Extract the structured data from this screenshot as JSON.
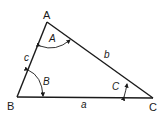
{
  "diagram": {
    "type": "triangle",
    "vertices": {
      "A": {
        "label": "A"
      },
      "B": {
        "label": "B"
      },
      "C": {
        "label": "C"
      }
    },
    "sides": {
      "a": {
        "label": "a",
        "between": [
          "B",
          "C"
        ]
      },
      "b": {
        "label": "b",
        "between": [
          "A",
          "C"
        ]
      },
      "c": {
        "label": "c",
        "between": [
          "A",
          "B"
        ]
      }
    },
    "angles": {
      "A": {
        "label": "A"
      },
      "B": {
        "label": "B"
      },
      "C": {
        "label": "C"
      }
    },
    "colors": {
      "stroke": "#1a1a1a",
      "background": "#ffffff"
    }
  }
}
